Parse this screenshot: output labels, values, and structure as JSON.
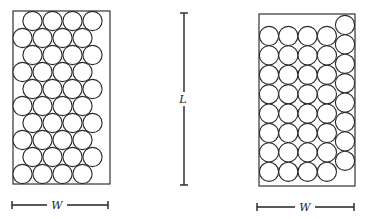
{
  "figure": {
    "left_panel": {
      "packing": "hexagonal",
      "box": {
        "x": 13,
        "y": 11,
        "w": 97,
        "h": 173
      },
      "circle_radius": 9.6,
      "rows": 10,
      "per_row": 4,
      "row_y_start": 21,
      "row_y_step": 17.0,
      "flush_x_start": 22.5,
      "offset_x_start": 32.5,
      "x_step": 20,
      "first_row_offset": true,
      "dimension": {
        "label": "W",
        "x1": 12,
        "x2": 108,
        "y": 205,
        "label_x": 57
      }
    },
    "center_dimension": {
      "label": "L",
      "x": 184,
      "y1": 13,
      "y2": 185,
      "gap_top": 92,
      "gap_bottom": 106,
      "label_y": 103
    },
    "right_panel": {
      "packing": "square",
      "box": {
        "x": 259,
        "y": 14,
        "w": 96,
        "h": 172
      },
      "circle_radius": 9.6,
      "grid_cols": 4,
      "grid_rows": 8,
      "grid_x_start": 269,
      "grid_y_start": 36,
      "x_step": 19.3,
      "y_step": 19.4,
      "extra_column": {
        "x": 345,
        "y_start": 25,
        "count": 8
      },
      "dimension": {
        "label": "W",
        "x1": 257,
        "x2": 354,
        "y": 207,
        "label_x": 305
      }
    }
  }
}
